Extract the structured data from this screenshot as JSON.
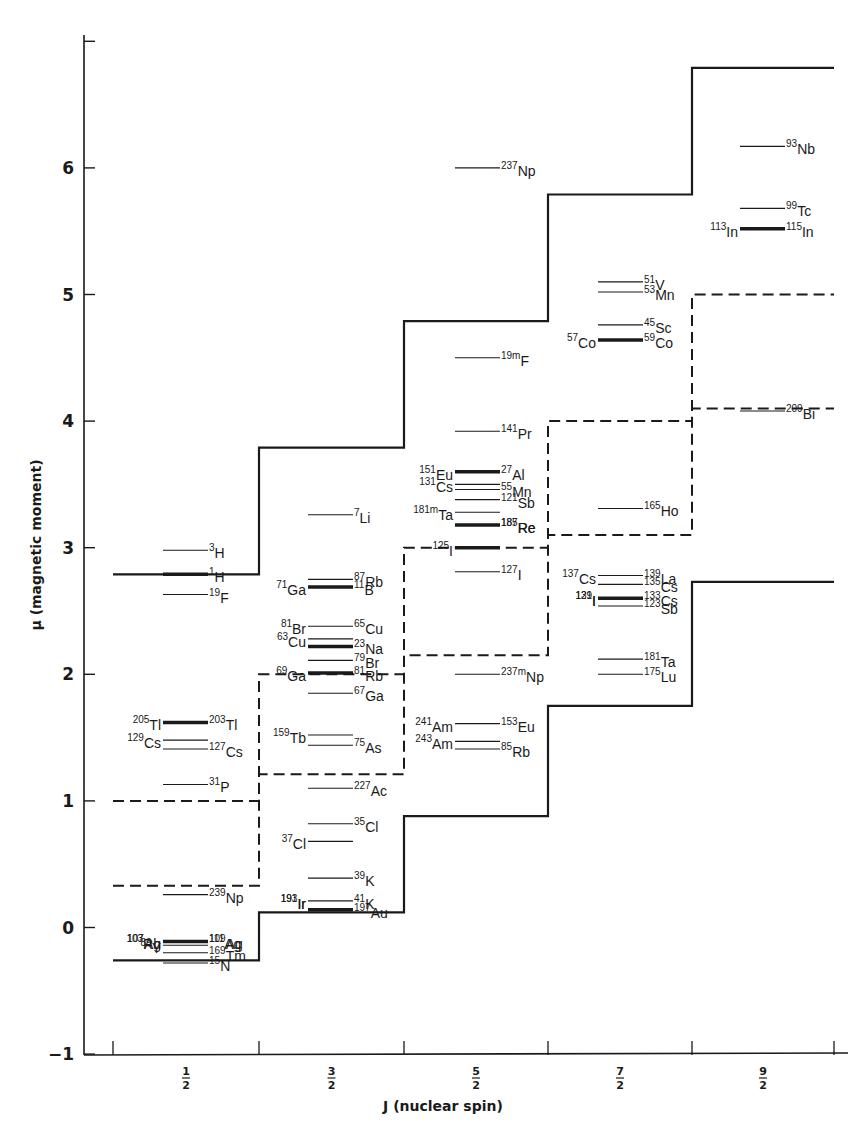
{
  "chart_data": {
    "type": "line",
    "title": "",
    "xlabel": "J (nuclear spin)",
    "ylabel": "μ (magnetic moment)",
    "ylim": [
      -1,
      7
    ],
    "yticks": [
      -1,
      0,
      1,
      2,
      3,
      4,
      5,
      6,
      7
    ],
    "ytick_labels": [
      "-1",
      "0",
      "1",
      "2",
      "3",
      "4",
      "5",
      "6",
      ""
    ],
    "categories": [
      "1/2",
      "3/2",
      "5/2",
      "7/2",
      "9/2"
    ],
    "grid": false,
    "legend": null,
    "schmidt_lines": [
      {
        "name": "solid-upper",
        "style": "solid",
        "values": [
          2.79,
          3.79,
          4.79,
          5.79,
          6.79
        ]
      },
      {
        "name": "solid-lower",
        "style": "solid",
        "values": [
          -0.26,
          0.12,
          0.88,
          1.75,
          2.73
        ]
      },
      {
        "name": "dashed-upper",
        "style": "dashed",
        "values": [
          1.0,
          2.0,
          3.0,
          4.0,
          5.0
        ]
      },
      {
        "name": "dashed-lower",
        "style": "dashed",
        "values": [
          0.33,
          1.21,
          2.15,
          3.1,
          4.1
        ]
      }
    ],
    "nuclides": [
      {
        "col": 0,
        "mu": 2.98,
        "thick": false,
        "labels": [
          {
            "side": "r",
            "mass": "3",
            "el": "H"
          }
        ]
      },
      {
        "col": 0,
        "mu": 2.79,
        "thick": true,
        "labels": [
          {
            "side": "r",
            "mass": "1",
            "el": "H"
          }
        ]
      },
      {
        "col": 0,
        "mu": 2.63,
        "thick": false,
        "labels": [
          {
            "side": "r",
            "mass": "19",
            "el": "F"
          }
        ]
      },
      {
        "col": 0,
        "mu": 1.62,
        "thick": true,
        "labels": [
          {
            "side": "l",
            "mass": "205",
            "el": "Tl"
          },
          {
            "side": "r",
            "mass": "203",
            "el": "Tl"
          }
        ]
      },
      {
        "col": 0,
        "mu": 1.48,
        "thick": false,
        "labels": [
          {
            "side": "l",
            "mass": "129",
            "el": "Cs"
          }
        ]
      },
      {
        "col": 0,
        "mu": 1.41,
        "thick": false,
        "labels": [
          {
            "side": "r",
            "mass": "127",
            "el": "Cs"
          }
        ]
      },
      {
        "col": 0,
        "mu": 1.13,
        "thick": false,
        "labels": [
          {
            "side": "r",
            "mass": "31",
            "el": "P"
          }
        ]
      },
      {
        "col": 0,
        "mu": 0.26,
        "thick": false,
        "labels": [
          {
            "side": "r",
            "mass": "239",
            "el": "Np"
          }
        ]
      },
      {
        "col": 0,
        "mu": -0.11,
        "thick": true,
        "labels": [
          {
            "side": "l",
            "mass": "103",
            "el": "Rh"
          },
          {
            "side": "l",
            "mass": "107",
            "el": "Ag"
          },
          {
            "side": "r",
            "mass": "109",
            "el": "Ag"
          },
          {
            "side": "r",
            "mass": "111",
            "el": "Ag"
          }
        ]
      },
      {
        "col": 0,
        "mu": -0.2,
        "thick": false,
        "labels": [
          {
            "side": "r",
            "mass": "169",
            "el": "Tm"
          }
        ]
      },
      {
        "col": 0,
        "mu": -0.14,
        "thick": false,
        "labels": [
          {
            "side": "l",
            "mass": "89",
            "el": "Y"
          }
        ]
      },
      {
        "col": 0,
        "mu": -0.28,
        "thick": false,
        "labels": [
          {
            "side": "r",
            "mass": "15",
            "el": "N"
          }
        ]
      },
      {
        "col": 1,
        "mu": 3.26,
        "thick": false,
        "labels": [
          {
            "side": "r",
            "mass": "7",
            "el": "Li"
          }
        ]
      },
      {
        "col": 1,
        "mu": 2.75,
        "thick": false,
        "labels": [
          {
            "side": "r",
            "mass": "87",
            "el": "Rb"
          }
        ]
      },
      {
        "col": 1,
        "mu": 2.69,
        "thick": true,
        "labels": [
          {
            "side": "l",
            "mass": "71",
            "el": "Ga"
          },
          {
            "side": "r",
            "mass": "11",
            "el": "B"
          }
        ]
      },
      {
        "col": 1,
        "mu": 2.38,
        "thick": false,
        "labels": [
          {
            "side": "l",
            "mass": "81",
            "el": "Br"
          },
          {
            "side": "r",
            "mass": "65",
            "el": "Cu"
          }
        ]
      },
      {
        "col": 1,
        "mu": 2.28,
        "thick": false,
        "labels": [
          {
            "side": "l",
            "mass": "63",
            "el": "Cu"
          }
        ]
      },
      {
        "col": 1,
        "mu": 2.22,
        "thick": true,
        "labels": [
          {
            "side": "r",
            "mass": "23",
            "el": "Na"
          }
        ]
      },
      {
        "col": 1,
        "mu": 2.11,
        "thick": false,
        "labels": [
          {
            "side": "r",
            "mass": "79",
            "el": "Br"
          }
        ]
      },
      {
        "col": 1,
        "mu": 2.01,
        "thick": true,
        "labels": [
          {
            "side": "l",
            "mass": "69",
            "el": "Ga"
          },
          {
            "side": "r",
            "mass": "81",
            "el": "Rb"
          }
        ]
      },
      {
        "col": 1,
        "mu": 1.85,
        "thick": false,
        "labels": [
          {
            "side": "r",
            "mass": "67",
            "el": "Ga"
          }
        ]
      },
      {
        "col": 1,
        "mu": 1.52,
        "thick": false,
        "labels": [
          {
            "side": "l",
            "mass": "159",
            "el": "Tb"
          }
        ]
      },
      {
        "col": 1,
        "mu": 1.44,
        "thick": false,
        "labels": [
          {
            "side": "r",
            "mass": "75",
            "el": "As"
          }
        ]
      },
      {
        "col": 1,
        "mu": 1.1,
        "thick": false,
        "labels": [
          {
            "side": "r",
            "mass": "227",
            "el": "Ac"
          }
        ]
      },
      {
        "col": 1,
        "mu": 0.82,
        "thick": false,
        "labels": [
          {
            "side": "r",
            "mass": "35",
            "el": "Cl"
          }
        ]
      },
      {
        "col": 1,
        "mu": 0.68,
        "thick": false,
        "labels": [
          {
            "side": "l",
            "mass": "37",
            "el": "Cl"
          }
        ]
      },
      {
        "col": 1,
        "mu": 0.39,
        "thick": false,
        "labels": [
          {
            "side": "r",
            "mass": "39",
            "el": "K"
          }
        ]
      },
      {
        "col": 1,
        "mu": 0.21,
        "thick": false,
        "labels": [
          {
            "side": "l",
            "mass": "191",
            "el": "Ir"
          },
          {
            "side": "l",
            "mass": "193",
            "el": "Ir"
          },
          {
            "side": "r",
            "mass": "41",
            "el": "K"
          }
        ]
      },
      {
        "col": 1,
        "mu": 0.14,
        "thick": true,
        "labels": [
          {
            "side": "r",
            "mass": "197",
            "el": "Au"
          }
        ]
      },
      {
        "col": 2,
        "mu": 6.0,
        "thick": false,
        "labels": [
          {
            "side": "r",
            "mass": "237",
            "el": "Np"
          }
        ]
      },
      {
        "col": 2,
        "mu": 4.5,
        "thick": false,
        "labels": [
          {
            "side": "r",
            "mass": "19m",
            "el": "F"
          }
        ]
      },
      {
        "col": 2,
        "mu": 3.92,
        "thick": false,
        "labels": [
          {
            "side": "r",
            "mass": "141",
            "el": "Pr"
          }
        ]
      },
      {
        "col": 2,
        "mu": 3.6,
        "thick": true,
        "labels": [
          {
            "side": "l",
            "mass": "151",
            "el": "Eu"
          },
          {
            "side": "r",
            "mass": "27",
            "el": "Al"
          }
        ]
      },
      {
        "col": 2,
        "mu": 3.5,
        "thick": false,
        "labels": [
          {
            "side": "l",
            "mass": "131",
            "el": "Cs"
          }
        ]
      },
      {
        "col": 2,
        "mu": 3.46,
        "thick": false,
        "labels": [
          {
            "side": "r",
            "mass": "55",
            "el": "Mn"
          }
        ]
      },
      {
        "col": 2,
        "mu": 3.38,
        "thick": false,
        "labels": [
          {
            "side": "r",
            "mass": "121",
            "el": "Sb"
          }
        ]
      },
      {
        "col": 2,
        "mu": 3.28,
        "thick": false,
        "labels": [
          {
            "side": "l",
            "mass": "181m",
            "el": "Ta"
          }
        ]
      },
      {
        "col": 2,
        "mu": 3.18,
        "thick": true,
        "labels": [
          {
            "side": "r",
            "mass": "185",
            "el": "Re"
          },
          {
            "side": "r",
            "mass": "187",
            "el": "Re"
          }
        ]
      },
      {
        "col": 2,
        "mu": 3.0,
        "thick": true,
        "labels": [
          {
            "side": "l",
            "mass": "125",
            "el": "I"
          }
        ]
      },
      {
        "col": 2,
        "mu": 2.81,
        "thick": false,
        "labels": [
          {
            "side": "r",
            "mass": "127",
            "el": "I"
          }
        ]
      },
      {
        "col": 2,
        "mu": 2.0,
        "thick": false,
        "labels": [
          {
            "side": "r",
            "mass": "237m",
            "el": "Np"
          }
        ]
      },
      {
        "col": 2,
        "mu": 1.61,
        "thick": false,
        "labels": [
          {
            "side": "l",
            "mass": "241",
            "el": "Am"
          },
          {
            "side": "r",
            "mass": "153",
            "el": "Eu"
          }
        ]
      },
      {
        "col": 2,
        "mu": 1.47,
        "thick": false,
        "labels": [
          {
            "side": "l",
            "mass": "243",
            "el": "Am"
          }
        ]
      },
      {
        "col": 2,
        "mu": 1.41,
        "thick": false,
        "labels": [
          {
            "side": "r",
            "mass": "85",
            "el": "Rb"
          }
        ]
      },
      {
        "col": 3,
        "mu": 5.1,
        "thick": false,
        "labels": [
          {
            "side": "r",
            "mass": "51",
            "el": "V"
          }
        ]
      },
      {
        "col": 3,
        "mu": 5.02,
        "thick": false,
        "labels": [
          {
            "side": "r",
            "mass": "53",
            "el": "Mn"
          }
        ]
      },
      {
        "col": 3,
        "mu": 4.76,
        "thick": false,
        "labels": [
          {
            "side": "r",
            "mass": "45",
            "el": "Sc"
          }
        ]
      },
      {
        "col": 3,
        "mu": 4.64,
        "thick": true,
        "labels": [
          {
            "side": "l",
            "mass": "57",
            "el": "Co"
          },
          {
            "side": "r",
            "mass": "59",
            "el": "Co"
          }
        ]
      },
      {
        "col": 3,
        "mu": 3.31,
        "thick": false,
        "labels": [
          {
            "side": "r",
            "mass": "165",
            "el": "Ho"
          }
        ]
      },
      {
        "col": 3,
        "mu": 2.78,
        "thick": false,
        "labels": [
          {
            "side": "l",
            "mass": "137",
            "el": "Cs"
          },
          {
            "side": "r",
            "mass": "139",
            "el": "La"
          }
        ]
      },
      {
        "col": 3,
        "mu": 2.71,
        "thick": false,
        "labels": [
          {
            "side": "r",
            "mass": "135",
            "el": "Cs"
          }
        ]
      },
      {
        "col": 3,
        "mu": 2.6,
        "thick": true,
        "labels": [
          {
            "side": "l",
            "mass": "129",
            "el": "I"
          },
          {
            "side": "l",
            "mass": "131",
            "el": "I"
          },
          {
            "side": "r",
            "mass": "133",
            "el": "Cs"
          }
        ]
      },
      {
        "col": 3,
        "mu": 2.54,
        "thick": false,
        "labels": [
          {
            "side": "r",
            "mass": "123",
            "el": "Sb"
          }
        ]
      },
      {
        "col": 3,
        "mu": 2.12,
        "thick": false,
        "labels": [
          {
            "side": "r",
            "mass": "181",
            "el": "Ta"
          }
        ]
      },
      {
        "col": 3,
        "mu": 2.0,
        "thick": false,
        "labels": [
          {
            "side": "r",
            "mass": "175",
            "el": "Lu"
          }
        ]
      },
      {
        "col": 4,
        "mu": 6.17,
        "thick": false,
        "labels": [
          {
            "side": "r",
            "mass": "93",
            "el": "Nb"
          }
        ]
      },
      {
        "col": 4,
        "mu": 5.68,
        "thick": false,
        "labels": [
          {
            "side": "r",
            "mass": "99",
            "el": "Tc"
          }
        ]
      },
      {
        "col": 4,
        "mu": 5.52,
        "thick": true,
        "labels": [
          {
            "side": "l",
            "mass": "113",
            "el": "In"
          },
          {
            "side": "r",
            "mass": "115",
            "el": "In"
          }
        ]
      },
      {
        "col": 4,
        "mu": 4.08,
        "thick": false,
        "labels": [
          {
            "side": "r",
            "mass": "209",
            "el": "Bi"
          }
        ]
      }
    ]
  },
  "axes": {
    "y_title": "μ (magnetic moment)",
    "x_title": "J (nuclear spin)",
    "x_fractions": [
      {
        "num": "1",
        "den": "2"
      },
      {
        "num": "3",
        "den": "2"
      },
      {
        "num": "5",
        "den": "2"
      },
      {
        "num": "7",
        "den": "2"
      },
      {
        "num": "9",
        "den": "2"
      }
    ],
    "y_tick_labels": [
      "6",
      "5",
      "4",
      "3",
      "2",
      "1",
      "0",
      "−1"
    ]
  }
}
